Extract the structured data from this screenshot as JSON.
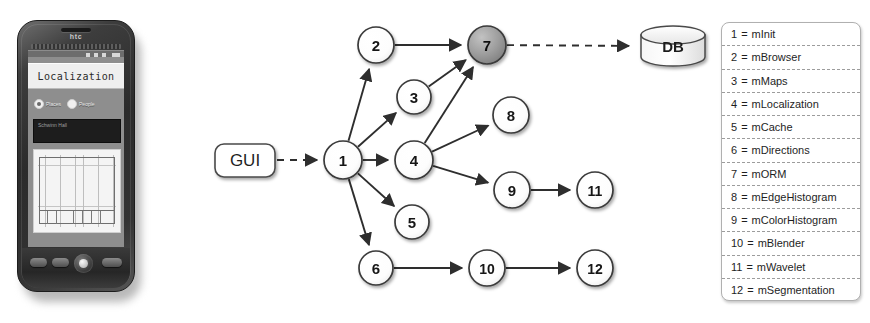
{
  "phone": {
    "brand": "htc",
    "app": {
      "title": "Localization",
      "radios": [
        {
          "label": "Places",
          "selected": true
        },
        {
          "label": "People",
          "selected": false
        }
      ],
      "search_value": "Schwinn Hall",
      "map_alt": "floor-plan"
    }
  },
  "diagram": {
    "gui_label": "GUI",
    "db_label": "DB",
    "nodes": [
      {
        "id": "1",
        "label": "1",
        "cx": 343,
        "cy": 160,
        "r": 19,
        "highlight": false
      },
      {
        "id": "2",
        "label": "2",
        "cx": 376,
        "cy": 45,
        "r": 18,
        "highlight": false
      },
      {
        "id": "3",
        "label": "3",
        "cx": 414,
        "cy": 97,
        "r": 17,
        "highlight": false
      },
      {
        "id": "4",
        "label": "4",
        "cx": 414,
        "cy": 160,
        "r": 19,
        "highlight": false
      },
      {
        "id": "5",
        "label": "5",
        "cx": 412,
        "cy": 222,
        "r": 17,
        "highlight": false
      },
      {
        "id": "6",
        "label": "6",
        "cx": 376,
        "cy": 268,
        "r": 17,
        "highlight": false
      },
      {
        "id": "7",
        "label": "7",
        "cx": 487,
        "cy": 45,
        "r": 19,
        "highlight": true
      },
      {
        "id": "8",
        "label": "8",
        "cx": 511,
        "cy": 115,
        "r": 18,
        "highlight": false
      },
      {
        "id": "9",
        "label": "9",
        "cx": 512,
        "cy": 190,
        "r": 18,
        "highlight": false
      },
      {
        "id": "10",
        "label": "10",
        "cx": 487,
        "cy": 268,
        "r": 18,
        "highlight": false
      },
      {
        "id": "11",
        "label": "11",
        "cx": 595,
        "cy": 190,
        "r": 18,
        "highlight": false
      },
      {
        "id": "12",
        "label": "12",
        "cx": 595,
        "cy": 268,
        "r": 18,
        "highlight": false
      }
    ],
    "edges": [
      {
        "from": "GUI",
        "to": "1",
        "style": "dashed"
      },
      {
        "from": "1",
        "to": "2",
        "style": "solid"
      },
      {
        "from": "1",
        "to": "3",
        "style": "solid"
      },
      {
        "from": "1",
        "to": "4",
        "style": "solid"
      },
      {
        "from": "1",
        "to": "5",
        "style": "solid"
      },
      {
        "from": "1",
        "to": "6",
        "style": "solid"
      },
      {
        "from": "2",
        "to": "7",
        "style": "solid"
      },
      {
        "from": "3",
        "to": "7",
        "style": "solid"
      },
      {
        "from": "4",
        "to": "7",
        "style": "solid"
      },
      {
        "from": "4",
        "to": "8",
        "style": "solid"
      },
      {
        "from": "4",
        "to": "9",
        "style": "solid"
      },
      {
        "from": "9",
        "to": "11",
        "style": "solid"
      },
      {
        "from": "6",
        "to": "10",
        "style": "solid"
      },
      {
        "from": "10",
        "to": "12",
        "style": "solid"
      },
      {
        "from": "7",
        "to": "DB",
        "style": "dashed"
      }
    ],
    "colors": {
      "node_fill": "#ffffff",
      "node_stroke": "#3a3a3a",
      "highlight_fill": "#9a9a9a",
      "edge": "#2e2e2e"
    }
  },
  "legend": {
    "rows": [
      {
        "id": "1",
        "eq": "=",
        "name": "mInit"
      },
      {
        "id": "2",
        "eq": "=",
        "name": "mBrowser"
      },
      {
        "id": "3",
        "eq": "=",
        "name": "mMaps"
      },
      {
        "id": "4",
        "eq": "=",
        "name": "mLocalization"
      },
      {
        "id": "5",
        "eq": "=",
        "name": "mCache"
      },
      {
        "id": "6",
        "eq": "=",
        "name": "mDirections"
      },
      {
        "id": "7",
        "eq": "=",
        "name": "mORM"
      },
      {
        "id": "8",
        "eq": "=",
        "name": "mEdgeHistogram"
      },
      {
        "id": "9",
        "eq": "=",
        "name": "mColorHistogram"
      },
      {
        "id": "10",
        "eq": "=",
        "name": "mBlender"
      },
      {
        "id": "11",
        "eq": "=",
        "name": "mWavelet"
      },
      {
        "id": "12",
        "eq": "=",
        "name": "mSegmentation"
      }
    ]
  }
}
